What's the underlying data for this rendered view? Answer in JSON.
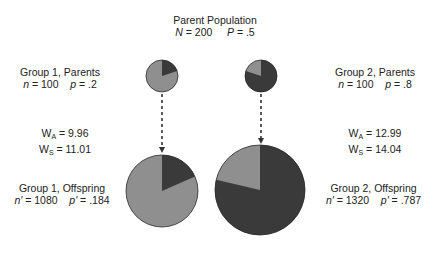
{
  "title": {
    "line1": "Parent Population",
    "n_label": "N",
    "n_value": "= 200",
    "p_label": "P",
    "p_value": "= .5"
  },
  "group1_parents": {
    "title": "Group 1, Parents",
    "n_label": "n",
    "n_value": "= 100",
    "p_label": "p",
    "p_value": "= .2"
  },
  "group2_parents": {
    "title": "Group 2, Parents",
    "n_label": "n",
    "n_value": "= 100",
    "p_label": "p",
    "p_value": "= .8"
  },
  "group1_fitness": {
    "wa_label": "W",
    "wa_sub": "A",
    "wa_value": "= 9.96",
    "ws_label": "W",
    "ws_sub": "S",
    "ws_value": "= 11.01"
  },
  "group2_fitness": {
    "wa_label": "W",
    "wa_sub": "A",
    "wa_value": "= 12.99",
    "ws_label": "W",
    "ws_sub": "S",
    "ws_value": "= 14.04"
  },
  "group1_offspring": {
    "title": "Group 1, Offspring",
    "n_label": "n'",
    "n_value": "= 1080",
    "p_label": "p'",
    "p_value": "= .184"
  },
  "group2_offspring": {
    "title": "Group 2, Offspring",
    "n_label": "n'",
    "n_value": "= 1320",
    "p_label": "p'",
    "p_value": "= .787"
  },
  "colors": {
    "altruist_dark": "#3a3a3a",
    "selfish_light": "#8f8f8f",
    "outline": "#2a2a2a",
    "arrow": "#333333"
  },
  "pies": [
    {
      "name": "group1-parents",
      "cx": 162,
      "cy": 76,
      "r": 16,
      "p_dark": 0.2
    },
    {
      "name": "group2-parents",
      "cx": 261,
      "cy": 76,
      "r": 16,
      "p_dark": 0.8
    },
    {
      "name": "group1-offspring",
      "cx": 162,
      "cy": 191,
      "r": 36,
      "p_dark": 0.184
    },
    {
      "name": "group2-offspring",
      "cx": 260,
      "cy": 190,
      "r": 45,
      "p_dark": 0.787
    }
  ]
}
